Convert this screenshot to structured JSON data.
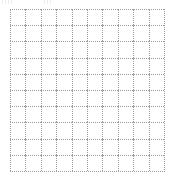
{
  "grid": {
    "rows": 10,
    "columns": 10,
    "line_style": "dotted",
    "line_color": "#9a9a9a",
    "background": "#ffffff"
  }
}
